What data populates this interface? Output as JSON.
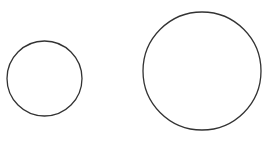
{
  "canvas": {
    "width": 267,
    "height": 145,
    "background": "#ffffff"
  },
  "shapes": [
    {
      "type": "circle",
      "name": "small-circle",
      "cx": 44.5,
      "cy": 78.5,
      "r": 37.5,
      "stroke": "#333333",
      "stroke_width": 1.3,
      "fill": "none"
    },
    {
      "type": "circle",
      "name": "large-circle",
      "cx": 202,
      "cy": 71,
      "r": 59,
      "stroke": "#333333",
      "stroke_width": 1.3,
      "fill": "none"
    }
  ]
}
